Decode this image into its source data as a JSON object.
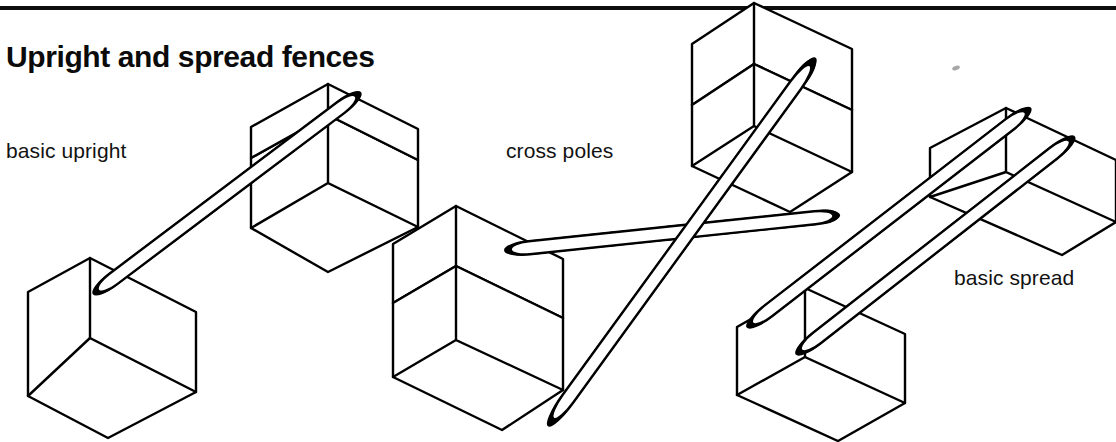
{
  "page": {
    "title": "Upright and spread fences",
    "background_color": "#ffffff",
    "ink_color": "#000000",
    "pole_dark_color": "#2b2b2b",
    "pole_light_color": "#ffffff",
    "rule": {
      "present": true,
      "color": "#0d0d0d",
      "thickness_px": 4
    }
  },
  "captions": {
    "basic_upright": "basic upright",
    "cross_poles": "cross poles",
    "basic_spread": "basic spread"
  },
  "figures": [
    {
      "name": "basic-upright",
      "label": "basic upright",
      "blocks": 2,
      "poles": 1,
      "description": "one striped pole resting between a low block and a higher block"
    },
    {
      "name": "cross-poles",
      "label": "cross poles",
      "blocks": 2,
      "poles": 2,
      "description": "two striped poles crossing in an X between two stacked blocks"
    },
    {
      "name": "basic-spread",
      "label": "basic spread",
      "blocks": 2,
      "poles": 2,
      "description": "two parallel striped poles spanning two blocks, set apart for spread"
    }
  ]
}
